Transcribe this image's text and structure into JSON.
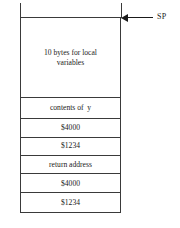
{
  "diagram": {
    "pointer": {
      "label": "SP",
      "icon": "left-arrow-icon",
      "target": "top-of-stack"
    },
    "colors": {
      "stroke": "#3a3a3a",
      "arrow": "#1a1a1a",
      "background": "#ffffff",
      "text": "#1a1a1a"
    },
    "cells": [
      {
        "label": "10 bytes for local\nvariables",
        "name": "stack-cell-local-variables"
      },
      {
        "label": "contents of  y",
        "name": "stack-cell-contents-of-y"
      },
      {
        "label": "$4000",
        "name": "stack-cell-4000-upper"
      },
      {
        "label": "$1234",
        "name": "stack-cell-1234-upper"
      },
      {
        "label": "return address",
        "name": "stack-cell-return-address"
      },
      {
        "label": "$4000",
        "name": "stack-cell-4000-lower"
      },
      {
        "label": "$1234",
        "name": "stack-cell-1234-lower"
      }
    ]
  }
}
